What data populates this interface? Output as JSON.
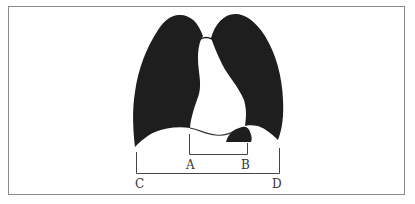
{
  "diagram": {
    "type": "chest-outline",
    "colors": {
      "lung_fill": "#1e1e1e",
      "line": "#444444",
      "frame": "#8a8a8a",
      "background": "#ffffff"
    },
    "labels": {
      "a": "A",
      "b": "B",
      "c": "C",
      "d": "D"
    },
    "brackets": [
      {
        "name": "A-B",
        "from": "A",
        "to": "B"
      },
      {
        "name": "C-D",
        "from": "C",
        "to": "D"
      }
    ]
  }
}
